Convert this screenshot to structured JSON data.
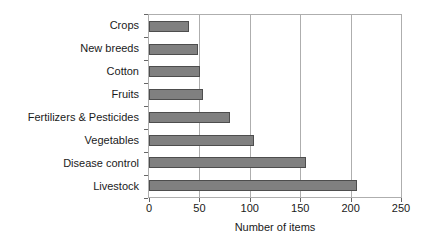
{
  "chart_data": {
    "type": "bar",
    "orientation": "horizontal",
    "title": "",
    "subtitle": "",
    "xlabel": "Number of items",
    "ylabel": "",
    "categories": [
      "Crops",
      "New breeds",
      "Cotton",
      "Fruits",
      "Fertilizers & Pesticides",
      "Vegetables",
      "Disease control",
      "Livestock"
    ],
    "values": [
      40,
      49,
      51,
      54,
      80,
      104,
      156,
      206
    ],
    "xlim": [
      0,
      250
    ],
    "xticks": [
      0,
      50,
      100,
      150,
      200,
      250
    ],
    "xtick_labels": [
      "0",
      "50",
      "100",
      "150",
      "200",
      "250"
    ],
    "grid": "vertical",
    "legend": "none",
    "bar_color": "#808080",
    "bar_border_color": "#4d4d4d",
    "plot_border_color": "#aeaeae",
    "gridline_color": "#aeaeae",
    "text_color": "#1a1a1a",
    "background": "#ffffff"
  }
}
